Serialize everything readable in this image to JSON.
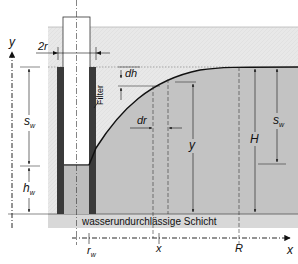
{
  "diagram": {
    "colors": {
      "unsaturated_soil": "#e6e6e6",
      "saturated_soil": "#c2c2c2",
      "well_water": "#bdbdbd",
      "impermeable_layer": "#d6d6d6",
      "casing": "#3a3a3a",
      "line": "#111111"
    },
    "labels": {
      "two_r": "2r",
      "filter": "Filter",
      "dh": "dh",
      "dr": "dr",
      "s_w_left": "s",
      "s_w_left_sub": "w",
      "h_w": "h",
      "h_w_sub": "w",
      "y_dim": "y",
      "H": "H",
      "s_w_right": "s",
      "s_w_right_sub": "w",
      "impermeable_layer": "wasserundurchlässige Schicht",
      "axis_y": "y",
      "axis_x": "x",
      "tick_rw": "r",
      "tick_rw_sub": "w",
      "tick_x": "x",
      "tick_R": "R"
    }
  }
}
